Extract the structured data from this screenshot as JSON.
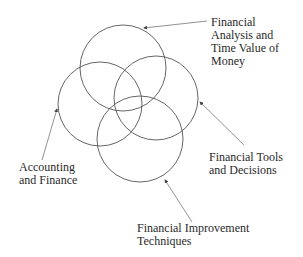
{
  "diagram": {
    "type": "venn",
    "stroke_color": "#555555",
    "arrow_color": "#777777",
    "circles": [
      {
        "id": "financial-analysis",
        "cx": 123,
        "cy": 68,
        "r": 43
      },
      {
        "id": "accounting-finance",
        "cx": 100,
        "cy": 104,
        "r": 42
      },
      {
        "id": "financial-tools",
        "cx": 156,
        "cy": 98,
        "r": 42
      },
      {
        "id": "financial-improvement",
        "cx": 140,
        "cy": 139,
        "r": 43
      }
    ],
    "labels": {
      "financial_analysis": "Financial\nAnalysis and\nTime Value of\nMoney",
      "financial_tools": "Financial Tools\nand Decisions",
      "accounting_finance": "Accounting\nand Finance",
      "financial_improvement": "Financial Improvement\nTechniques"
    }
  }
}
